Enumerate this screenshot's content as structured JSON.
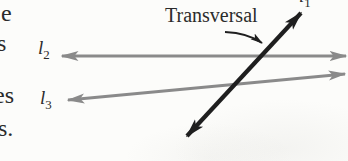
{
  "diagram": {
    "labels": {
      "transversal": "Transversal",
      "line1": {
        "base": "l",
        "sub": "1"
      },
      "line2": {
        "base": "l",
        "sub": "2"
      },
      "line3": {
        "base": "l",
        "sub": "3"
      }
    },
    "margin_fragments": [
      "e",
      "s",
      "es",
      "s."
    ],
    "colors": {
      "line_gray": "#8a8a8a",
      "line_black": "#1f1f1f",
      "text": "#2b2b2b",
      "background": "#fcfcfa"
    }
  }
}
